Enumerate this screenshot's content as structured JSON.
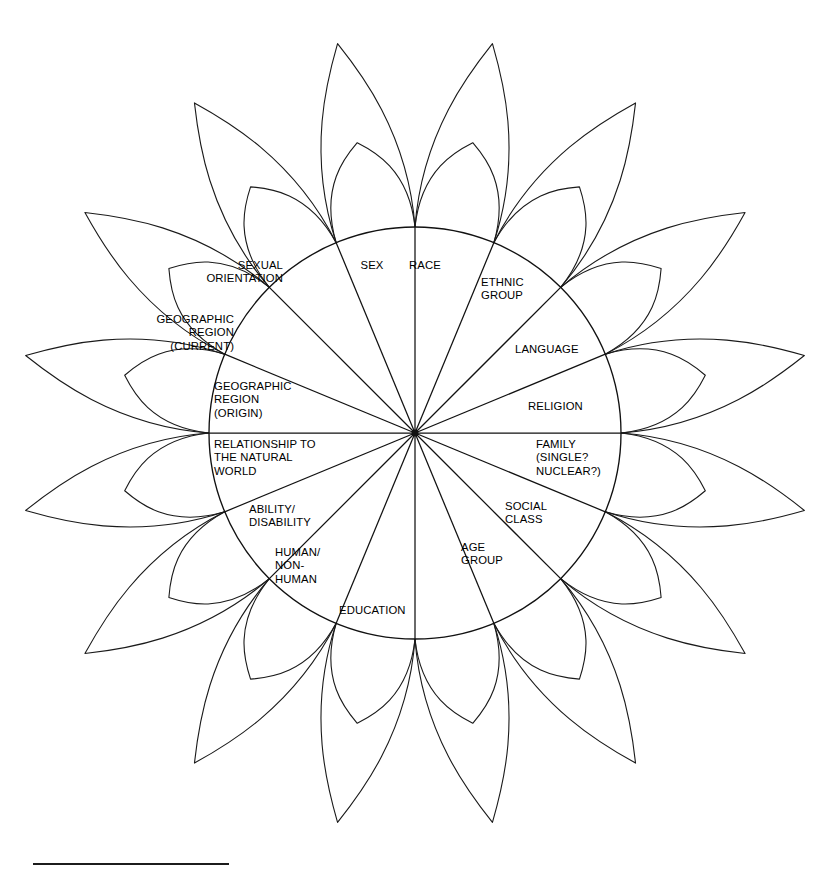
{
  "figure": {
    "kind": "radial-petal-wheel",
    "title_visible": false,
    "geometry": {
      "center_x": 415,
      "center_y": 433,
      "core_radius": 206,
      "sector_count": 16,
      "sector_angle_deg": 22.5,
      "long_petal_tip_radius": 397,
      "short_petal_tip_radius": 296,
      "long_petal_bulge": 0.4,
      "short_petal_bulge": 0.52,
      "stroke_color": "#1a1a1a",
      "background_color": "#ffffff"
    },
    "spoke_angles_deg": [
      0,
      22.5,
      45,
      67.5,
      90,
      112.5,
      135,
      157.5,
      180,
      202.5,
      225,
      247.5,
      270,
      292.5,
      315,
      337.5
    ],
    "sectors": [
      {
        "id": "sex",
        "label": "SEX",
        "align": "center",
        "x": 372,
        "y": 259
      },
      {
        "id": "race",
        "label": "RACE",
        "align": "center",
        "x": 425,
        "y": 259
      },
      {
        "id": "ethnic-group",
        "label": "ETHNIC\nGROUP",
        "align": "left",
        "x": 481,
        "y": 276
      },
      {
        "id": "language",
        "label": "LANGUAGE",
        "align": "left",
        "x": 515,
        "y": 343
      },
      {
        "id": "religion",
        "label": "RELIGION",
        "align": "left",
        "x": 528,
        "y": 400
      },
      {
        "id": "family",
        "label": "FAMILY\n(SINGLE?\nNUCLEAR?)",
        "align": "left",
        "x": 536,
        "y": 438
      },
      {
        "id": "social-class",
        "label": "SOCIAL\nCLASS",
        "align": "left",
        "x": 505,
        "y": 500
      },
      {
        "id": "age-group",
        "label": "AGE\nGROUP",
        "align": "left",
        "x": 461,
        "y": 541
      },
      {
        "id": "unlabeled-sector",
        "label": "",
        "align": "center",
        "x": 415,
        "y": 596
      },
      {
        "id": "education",
        "label": "EDUCATION",
        "align": "left",
        "x": 339,
        "y": 604
      },
      {
        "id": "human-non-human",
        "label": "HUMAN/\nNON-\nHUMAN",
        "align": "left",
        "x": 275,
        "y": 546
      },
      {
        "id": "ability-disability",
        "label": "ABILITY/\nDISABILITY",
        "align": "left",
        "x": 249,
        "y": 503
      },
      {
        "id": "relationship-natural-world",
        "label": "RELATIONSHIP TO\nTHE NATURAL\nWORLD",
        "align": "left",
        "x": 214,
        "y": 438
      },
      {
        "id": "geographic-region-origin",
        "label": "GEOGRAPHIC\nREGION\n(ORIGIN)",
        "align": "left",
        "x": 214,
        "y": 380
      },
      {
        "id": "geographic-region-current",
        "label": "GEOGRAPHIC\nREGION\n(CURRENT)",
        "align": "right",
        "x": 234,
        "y": 313
      },
      {
        "id": "sexual-orientation",
        "label": "SEXUAL\nORIENTATION",
        "align": "right",
        "x": 283,
        "y": 259
      }
    ],
    "footer_rule": {
      "present": true,
      "x": 33,
      "y": 855,
      "width": 196,
      "thickness": 2
    }
  }
}
